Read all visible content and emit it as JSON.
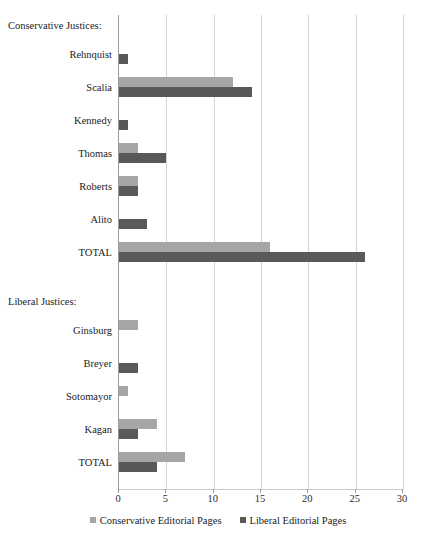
{
  "chart_data": {
    "type": "bar",
    "orientation": "horizontal",
    "title": "",
    "xlabel": "",
    "ylabel": "",
    "xlim": [
      0,
      30
    ],
    "xticks": [
      "0",
      "5",
      "10",
      "15",
      "20",
      "25",
      "30"
    ],
    "grid": "vertical",
    "legend_position": "bottom",
    "colors": {
      "conservative": "#a6a6a6",
      "liberal": "#595959",
      "gridline": "#d4d4d4",
      "axis": "#9a9a9a",
      "text": "#222222",
      "background": "#ffffff"
    },
    "series": [
      {
        "name": "Conservative Editorial Pages",
        "color": "#a6a6a6"
      },
      {
        "name": "Liberal Editorial Pages",
        "color": "#595959"
      }
    ],
    "groups": [
      {
        "heading": "Conservative Justices:",
        "rows": [
          {
            "category": "Rehnquist",
            "conservative": 0,
            "liberal": 1
          },
          {
            "category": "Scalia",
            "conservative": 12,
            "liberal": 14
          },
          {
            "category": "Kennedy",
            "conservative": 0,
            "liberal": 1
          },
          {
            "category": "Thomas",
            "conservative": 2,
            "liberal": 5
          },
          {
            "category": "Roberts",
            "conservative": 2,
            "liberal": 2
          },
          {
            "category": "Alito",
            "conservative": 0,
            "liberal": 3
          },
          {
            "category": "TOTAL",
            "conservative": 16,
            "liberal": 26
          }
        ]
      },
      {
        "heading": "Liberal Justices:",
        "rows": [
          {
            "category": "Ginsburg",
            "conservative": 2,
            "liberal": 0
          },
          {
            "category": "Breyer",
            "conservative": 0,
            "liberal": 2
          },
          {
            "category": "Sotomayor",
            "conservative": 1,
            "liberal": 0
          },
          {
            "category": "Kagan",
            "conservative": 4,
            "liberal": 2
          },
          {
            "category": "TOTAL",
            "conservative": 7,
            "liberal": 4
          }
        ]
      }
    ]
  }
}
